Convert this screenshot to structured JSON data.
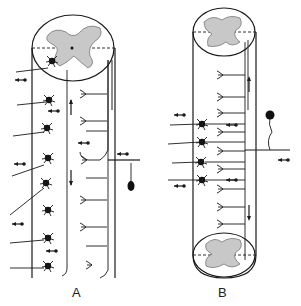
{
  "figure": {
    "type": "neuroanatomy-diagram",
    "panels": [
      {
        "id": "A",
        "label": "A",
        "description": "Spinal cord segment with gray matter cross-section at top; incoming dorsal root fiber on right branching into ascending/descending collaterals; motor neurons with axons exiting left"
      },
      {
        "id": "B",
        "label": "B",
        "description": "Spinal cord segment with gray matter cross-sections at top and bottom; dorsal root ganglion cell on right; fiber branches ascend and descend to synapse with interneurons and motor neurons"
      }
    ],
    "colors": {
      "ink": "#1a1a1a",
      "gray_matter": "#c8c8c8",
      "background": "#ffffff"
    }
  }
}
